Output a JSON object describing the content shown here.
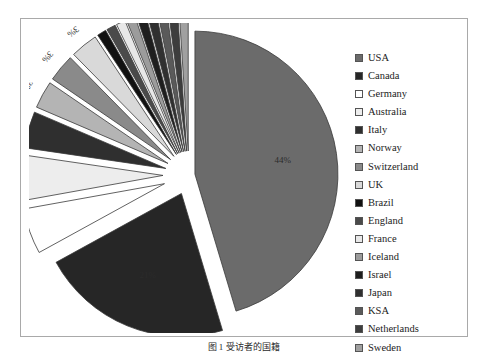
{
  "caption": "图 1  受访者的国籍",
  "frame": {
    "border_color": "#a9a9a9",
    "background": "#ffffff"
  },
  "legend": {
    "position": "right",
    "items": [
      {
        "label": "USA",
        "color": "#6b6b6b"
      },
      {
        "label": "Canada",
        "color": "#262626"
      },
      {
        "label": "Germany",
        "color": "#ffffff"
      },
      {
        "label": "Australia",
        "color": "#ededed"
      },
      {
        "label": "Italy",
        "color": "#2f2f2f"
      },
      {
        "label": "Norway",
        "color": "#b4b4b4"
      },
      {
        "label": "Switzerland",
        "color": "#8a8a8a"
      },
      {
        "label": "UK",
        "color": "#d9d9d9"
      },
      {
        "label": "Brazil",
        "color": "#111111"
      },
      {
        "label": "England",
        "color": "#4a4a4a"
      },
      {
        "label": "France",
        "color": "#e8e8e8"
      },
      {
        "label": "Iceland",
        "color": "#9c9c9c"
      },
      {
        "label": "Israel",
        "color": "#1e1e1e"
      },
      {
        "label": "Japan",
        "color": "#303030"
      },
      {
        "label": "KSA",
        "color": "#5a5a5a"
      },
      {
        "label": "Netherlands",
        "color": "#3d3d3d"
      },
      {
        "label": "Sweden",
        "color": "#a0a0a0"
      }
    ]
  },
  "chart_data": {
    "type": "pie",
    "title": "",
    "exploded": true,
    "start_angle_deg": -90,
    "direction": "clockwise",
    "labels_format": "percent",
    "categories": [
      "USA",
      "Canada",
      "Germany",
      "Australia",
      "Italy",
      "Norway",
      "Switzerland",
      "UK",
      "Brazil",
      "England",
      "France",
      "Iceland",
      "Israel",
      "Japan",
      "KSA",
      "Netherlands",
      "Sweden"
    ],
    "values": [
      44,
      21,
      5,
      5,
      4,
      3,
      3,
      3,
      1,
      1,
      1,
      1,
      1,
      1,
      1,
      1,
      1
    ],
    "value_labels": [
      "44%",
      "21%",
      "5%",
      "5%",
      "4%",
      "3%",
      "3%",
      "3%",
      "1%",
      "1%",
      "1%",
      "1%",
      "1%",
      "1%",
      "1%",
      "1%",
      "1%"
    ],
    "colors": [
      "#6b6b6b",
      "#262626",
      "#ffffff",
      "#ededed",
      "#2f2f2f",
      "#b4b4b4",
      "#8a8a8a",
      "#d9d9d9",
      "#111111",
      "#4a4a4a",
      "#e8e8e8",
      "#9c9c9c",
      "#1e1e1e",
      "#303030",
      "#5a5a5a",
      "#3d3d3d",
      "#a0a0a0"
    ],
    "legend_position": "right",
    "grid": false
  }
}
